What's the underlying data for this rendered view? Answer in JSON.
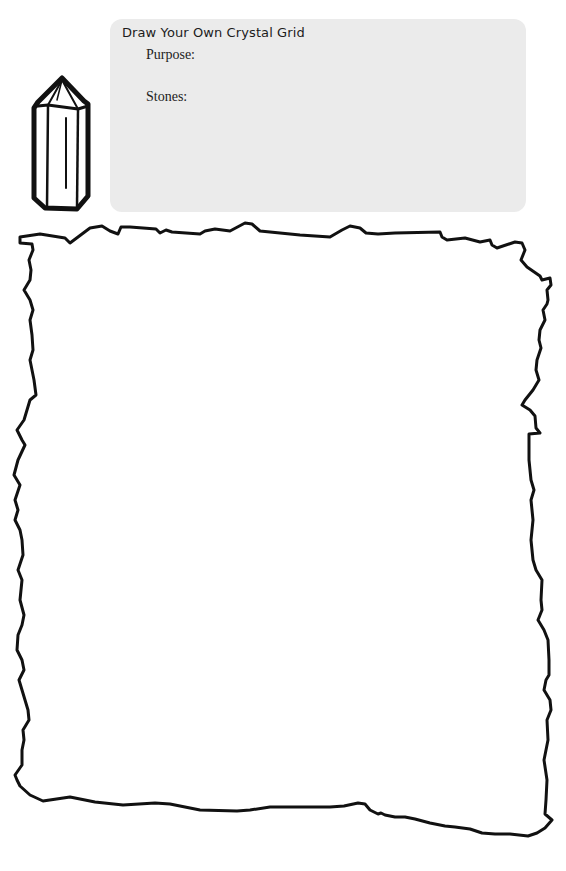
{
  "worksheet": {
    "title": "Draw Your Own Crystal Grid",
    "fields": [
      {
        "label": "Purpose:",
        "value": ""
      },
      {
        "label": "Stones:",
        "value": ""
      }
    ],
    "icon": "crystal-point-icon",
    "drawing_area": "torn-paper-frame",
    "colors": {
      "info_box_background": "#ebebeb",
      "line_art": "#111111"
    }
  }
}
